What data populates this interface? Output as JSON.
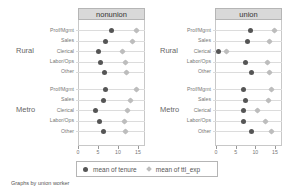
{
  "chart_data": {
    "type": "dot",
    "title": "",
    "note": "Graphs by union worker",
    "panels": [
      "nonunion",
      "union"
    ],
    "groups": [
      "Rural",
      "Metro"
    ],
    "categories": [
      "Prof/Mgmt",
      "Sales",
      "Clerical",
      "Labor/Ops",
      "Other"
    ],
    "xticks": [
      0,
      5,
      10,
      15
    ],
    "xlim": [
      0,
      16.5
    ],
    "legend": [
      "mean of tenure",
      "mean of ttl_exp"
    ],
    "series": [
      {
        "name": "mean of tenure",
        "marker": "circle",
        "color": "#555555",
        "values": {
          "nonunion": {
            "Rural": [
              8.4,
              6.9,
              5.1,
              5.5,
              6.6
            ],
            "Metro": [
              6.9,
              6.3,
              4.4,
              5.3,
              6.3
            ]
          },
          "union": {
            "Rural": [
              8.8,
              8.1,
              0.6,
              7.4,
              9.0
            ],
            "Metro": [
              7.0,
              7.6,
              7.1,
              7.0,
              9.0
            ]
          }
        }
      },
      {
        "name": "mean of ttl_exp",
        "marker": "diamond",
        "color": "#bdbdbd",
        "values": {
          "nonunion": {
            "Rural": [
              14.7,
              13.6,
              11.2,
              11.8,
              12.1
            ],
            "Metro": [
              14.7,
              13.0,
              12.3,
              11.7,
              11.9
            ]
          },
          "union": {
            "Rural": [
              14.8,
              13.7,
              2.6,
              13.1,
              13.7
            ],
            "Metro": [
              14.2,
              13.4,
              10.5,
              12.7,
              14.0
            ]
          }
        }
      }
    ],
    "grid": true,
    "legend_position": "bottom"
  },
  "labels": {
    "panel_nonunion": "nonunion",
    "panel_union": "union",
    "group_rural": "Rural",
    "group_metro": "Metro",
    "cat0": "Prof/Mgmt",
    "cat1": "Sales",
    "cat2": "Clerical",
    "cat3": "Labor/Ops",
    "cat4": "Other",
    "tick0": "0",
    "tick1": "5",
    "tick2": "10",
    "tick3": "15",
    "legend_tenure": "mean of tenure",
    "legend_ttl": "mean of ttl_exp",
    "note": "Graphs by union worker"
  }
}
